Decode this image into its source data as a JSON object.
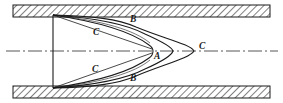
{
  "figure": {
    "background_color": "#ffffff",
    "line_color": "#1a1a1a",
    "wall_hatch_color": "#555555",
    "centerline_color": "#444444"
  },
  "walls": {
    "top": {
      "x": 13,
      "y": 5,
      "width": 257,
      "height": 12,
      "hatch": "diagonal-45",
      "label": "pipe-wall-top"
    },
    "bottom": {
      "x": 13,
      "y": 86,
      "width": 257,
      "height": 12,
      "hatch": "diagonal-45",
      "label": "pipe-wall-bottom"
    }
  },
  "centerline": {
    "y": 51,
    "x_start": 6,
    "x_end": 278,
    "style": "dash-dot",
    "label": "pipe-axis-centerline"
  },
  "entrance_plane": {
    "x": 53,
    "y_top": 15,
    "y_bottom": 88,
    "label": "entrance-plane"
  },
  "profiles": [
    {
      "id": "A",
      "label": "A",
      "description": "Earliest velocity profile, shortest penetration",
      "tip_x": 152,
      "label_x": 154,
      "label_y": 52
    },
    {
      "id": "B",
      "label": "B",
      "description": "Intermediate velocity profile",
      "tip_x": 174,
      "label_top_x": 130,
      "label_top_y": 15,
      "label_bottom_x": 130,
      "label_bottom_y": 74
    },
    {
      "id": "C",
      "label": "C",
      "description": "Fully developed velocity profile, longest penetration",
      "tip_x": 196,
      "label_top_x": 93,
      "label_top_y": 28,
      "label_bottom_x": 92,
      "label_bottom_y": 65,
      "label_tip_x": 199,
      "label_tip_y": 42
    }
  ],
  "labels": [
    {
      "name": "profile-label-B-top",
      "text": "B",
      "x": 130,
      "y": 15
    },
    {
      "name": "profile-label-C-top",
      "text": "C",
      "x": 93,
      "y": 28
    },
    {
      "name": "profile-label-C-tip",
      "text": "C",
      "x": 199,
      "y": 42
    },
    {
      "name": "profile-label-A",
      "text": "A",
      "x": 154,
      "y": 52
    },
    {
      "name": "profile-label-C-bottom",
      "text": "C",
      "x": 92,
      "y": 65
    },
    {
      "name": "profile-label-B-bottom",
      "text": "B",
      "x": 130,
      "y": 74
    }
  ]
}
